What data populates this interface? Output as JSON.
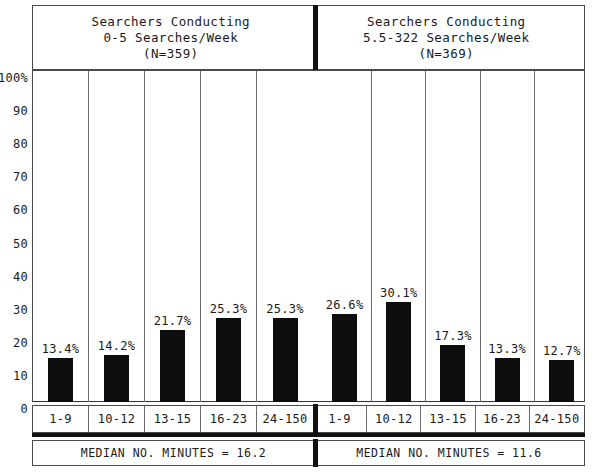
{
  "chart_data": {
    "type": "bar",
    "title": "",
    "xlabel": "",
    "ylabel": "100%",
    "ylim": [
      0,
      100
    ],
    "grid": true,
    "legend": "none",
    "y_ticks": [
      "100%",
      "90",
      "80",
      "70",
      "60",
      "50",
      "40",
      "30",
      "20",
      "10",
      "0"
    ],
    "y_tick_values": [
      100,
      90,
      80,
      70,
      60,
      50,
      40,
      30,
      20,
      10,
      0
    ],
    "categories": [
      "1-9",
      "10-12",
      "13-15",
      "16-23",
      "24-150"
    ],
    "panels": [
      {
        "header_line1": "Searchers Conducting",
        "header_line2": "0-5 Searches/Week",
        "header_line3": "(N=359)",
        "categories": [
          "1-9",
          "10-12",
          "13-15",
          "16-23",
          "24-150"
        ],
        "values": [
          13.4,
          14.2,
          21.7,
          25.3,
          25.3
        ],
        "value_labels": [
          "13.4%",
          "14.2%",
          "21.7%",
          "25.3%",
          "25.3%"
        ],
        "footer": "MEDIAN NO. MINUTES = 16.2"
      },
      {
        "header_line1": "Searchers Conducting",
        "header_line2": "5.5-322 Searches/Week",
        "header_line3": "(N=369)",
        "categories": [
          "1-9",
          "10-12",
          "13-15",
          "16-23",
          "24-150"
        ],
        "values": [
          26.6,
          30.1,
          17.3,
          13.3,
          12.7
        ],
        "value_labels": [
          "26.6%",
          "30.1%",
          "17.3%",
          "13.3%",
          "12.7%"
        ],
        "footer": "MEDIAN NO. MINUTES = 11.6"
      }
    ],
    "colors": {
      "bar": "#0d0d0d",
      "frame": "#4a4a4a",
      "gridline": "#6b6b6b",
      "divider": "#111111",
      "text": "#1a1a1a",
      "background": "#ffffff"
    }
  }
}
